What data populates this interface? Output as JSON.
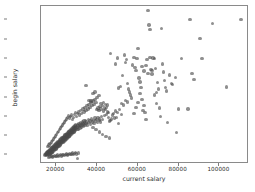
{
  "chart_data": {
    "type": "scatter",
    "title": "",
    "xlabel": "current salary",
    "ylabel": "begin salary",
    "xlim": [
      13000,
      114000
    ],
    "ylim": [
      8000,
      48500
    ],
    "grid": false,
    "legend": null,
    "marker": {
      "shape": "circle",
      "color": "#4b4b4b",
      "opacity": 0.62,
      "size_px": 3.4
    },
    "xticks": [
      20000,
      40000,
      60000,
      80000,
      100000
    ],
    "xtick_labels": [
      "20000",
      "40000",
      "60000",
      "80000",
      "100000"
    ],
    "yticks": [
      10000,
      15000,
      20000,
      25000,
      30000,
      35000,
      40000,
      45000
    ],
    "ytick_labels": [
      "10000",
      "15000",
      "20000",
      "25000",
      "30000",
      "35000",
      "40000",
      "45000"
    ],
    "points": [
      [
        15000,
        9800
      ],
      [
        15200,
        10100
      ],
      [
        15400,
        9900
      ],
      [
        15600,
        10300
      ],
      [
        15800,
        10000
      ],
      [
        15900,
        10500
      ],
      [
        16000,
        9750
      ],
      [
        16100,
        10200
      ],
      [
        16200,
        10600
      ],
      [
        16300,
        10000
      ],
      [
        16400,
        10800
      ],
      [
        16500,
        10300
      ],
      [
        16600,
        9900
      ],
      [
        16700,
        10450
      ],
      [
        16800,
        11000
      ],
      [
        16900,
        10200
      ],
      [
        17000,
        10700
      ],
      [
        17100,
        10000
      ],
      [
        17200,
        11200
      ],
      [
        17300,
        10500
      ],
      [
        17400,
        10900
      ],
      [
        17500,
        10100
      ],
      [
        17600,
        11400
      ],
      [
        17700,
        10600
      ],
      [
        17800,
        11000
      ],
      [
        17900,
        10300
      ],
      [
        18000,
        11600
      ],
      [
        18100,
        10800
      ],
      [
        18200,
        11200
      ],
      [
        18300,
        10400
      ],
      [
        18400,
        11800
      ],
      [
        18500,
        11000
      ],
      [
        18600,
        11400
      ],
      [
        18700,
        10600
      ],
      [
        18800,
        12000
      ],
      [
        18900,
        11200
      ],
      [
        19000,
        11600
      ],
      [
        19100,
        10800
      ],
      [
        19200,
        12200
      ],
      [
        19300,
        11400
      ],
      [
        19400,
        11800
      ],
      [
        19500,
        11000
      ],
      [
        19600,
        12400
      ],
      [
        19700,
        11600
      ],
      [
        19800,
        12000
      ],
      [
        19900,
        11200
      ],
      [
        20000,
        12600
      ],
      [
        20100,
        11800
      ],
      [
        20200,
        12200
      ],
      [
        20300,
        11400
      ],
      [
        20400,
        12800
      ],
      [
        20500,
        12000
      ],
      [
        20600,
        12400
      ],
      [
        20700,
        11600
      ],
      [
        20800,
        13000
      ],
      [
        20900,
        12200
      ],
      [
        21000,
        12600
      ],
      [
        21100,
        11800
      ],
      [
        21200,
        13200
      ],
      [
        21300,
        12400
      ],
      [
        21400,
        12800
      ],
      [
        21500,
        12000
      ],
      [
        21600,
        13400
      ],
      [
        21700,
        12600
      ],
      [
        21800,
        13000
      ],
      [
        21900,
        12200
      ],
      [
        22000,
        13600
      ],
      [
        22100,
        12800
      ],
      [
        22200,
        13200
      ],
      [
        22300,
        12400
      ],
      [
        22400,
        13800
      ],
      [
        22500,
        13000
      ],
      [
        22600,
        13400
      ],
      [
        22700,
        12600
      ],
      [
        22800,
        14000
      ],
      [
        22900,
        13200
      ],
      [
        23000,
        13600
      ],
      [
        23100,
        12800
      ],
      [
        23200,
        14200
      ],
      [
        23300,
        13400
      ],
      [
        23400,
        13800
      ],
      [
        23500,
        13000
      ],
      [
        23600,
        14400
      ],
      [
        23700,
        13600
      ],
      [
        23800,
        14000
      ],
      [
        23900,
        13200
      ],
      [
        24000,
        14600
      ],
      [
        24100,
        13800
      ],
      [
        24200,
        14200
      ],
      [
        24300,
        13400
      ],
      [
        24400,
        14800
      ],
      [
        24500,
        14000
      ],
      [
        24600,
        14400
      ],
      [
        24700,
        13600
      ],
      [
        24800,
        15000
      ],
      [
        24900,
        14200
      ],
      [
        25000,
        14600
      ],
      [
        25100,
        13800
      ],
      [
        25200,
        15200
      ],
      [
        25300,
        14400
      ],
      [
        25400,
        14800
      ],
      [
        25500,
        14000
      ],
      [
        25600,
        15400
      ],
      [
        25700,
        14600
      ],
      [
        25800,
        15000
      ],
      [
        25900,
        14200
      ],
      [
        26000,
        15600
      ],
      [
        26100,
        14800
      ],
      [
        26200,
        15200
      ],
      [
        26300,
        14400
      ],
      [
        26400,
        15800
      ],
      [
        26500,
        15000
      ],
      [
        26600,
        15400
      ],
      [
        26700,
        14600
      ],
      [
        26800,
        16000
      ],
      [
        26900,
        15200
      ],
      [
        27000,
        15600
      ],
      [
        27100,
        14800
      ],
      [
        27200,
        16200
      ],
      [
        27300,
        15400
      ],
      [
        27400,
        15800
      ],
      [
        27500,
        15000
      ],
      [
        27600,
        16400
      ],
      [
        27700,
        15600
      ],
      [
        27800,
        16000
      ],
      [
        27900,
        15200
      ],
      [
        28000,
        16600
      ],
      [
        28100,
        15800
      ],
      [
        28200,
        16200
      ],
      [
        28300,
        15400
      ],
      [
        28400,
        16800
      ],
      [
        28500,
        16000
      ],
      [
        28600,
        16400
      ],
      [
        28700,
        15600
      ],
      [
        28800,
        17000
      ],
      [
        28900,
        16200
      ],
      [
        29000,
        16600
      ],
      [
        29100,
        15800
      ],
      [
        29200,
        17200
      ],
      [
        29300,
        16400
      ],
      [
        29400,
        16800
      ],
      [
        29500,
        16000
      ],
      [
        29600,
        17400
      ],
      [
        29700,
        16600
      ],
      [
        29800,
        17000
      ],
      [
        29900,
        16200
      ],
      [
        30000,
        17600
      ],
      [
        30200,
        16800
      ],
      [
        30400,
        17200
      ],
      [
        30600,
        16400
      ],
      [
        30800,
        17800
      ],
      [
        31000,
        17000
      ],
      [
        31200,
        17400
      ],
      [
        31400,
        16600
      ],
      [
        31600,
        18000
      ],
      [
        31800,
        17200
      ],
      [
        32000,
        17600
      ],
      [
        32200,
        16800
      ],
      [
        32400,
        18200
      ],
      [
        32600,
        17400
      ],
      [
        32800,
        17800
      ],
      [
        33000,
        17000
      ],
      [
        33200,
        18400
      ],
      [
        33400,
        17600
      ],
      [
        33600,
        18000
      ],
      [
        33800,
        17200
      ],
      [
        34000,
        18600
      ],
      [
        34200,
        17800
      ],
      [
        34400,
        18200
      ],
      [
        34600,
        17400
      ],
      [
        34800,
        18800
      ],
      [
        35000,
        18000
      ],
      [
        35400,
        18400
      ],
      [
        35800,
        17600
      ],
      [
        36200,
        19000
      ],
      [
        36600,
        18200
      ],
      [
        37000,
        18600
      ],
      [
        37400,
        17800
      ],
      [
        37800,
        19200
      ],
      [
        38200,
        18400
      ],
      [
        38600,
        18800
      ],
      [
        39000,
        18000
      ],
      [
        39400,
        19400
      ],
      [
        39800,
        18600
      ],
      [
        40200,
        19000
      ],
      [
        40600,
        18200
      ],
      [
        41000,
        19600
      ],
      [
        41400,
        18800
      ],
      [
        41800,
        19200
      ],
      [
        42200,
        18400
      ],
      [
        42600,
        19800
      ],
      [
        43000,
        19000
      ],
      [
        17000,
        9200
      ],
      [
        17500,
        9400
      ],
      [
        18000,
        9600
      ],
      [
        18500,
        9300
      ],
      [
        19000,
        9500
      ],
      [
        19500,
        9700
      ],
      [
        20000,
        9400
      ],
      [
        20500,
        9600
      ],
      [
        21000,
        9800
      ],
      [
        21500,
        9500
      ],
      [
        22000,
        9700
      ],
      [
        22500,
        9900
      ],
      [
        23000,
        9600
      ],
      [
        23500,
        9800
      ],
      [
        24000,
        10000
      ],
      [
        24500,
        9700
      ],
      [
        25000,
        9900
      ],
      [
        25500,
        10100
      ],
      [
        26000,
        9800
      ],
      [
        26500,
        10000
      ],
      [
        27000,
        10200
      ],
      [
        27500,
        9900
      ],
      [
        28000,
        10100
      ],
      [
        28500,
        10300
      ],
      [
        29000,
        10000
      ],
      [
        29500,
        10200
      ],
      [
        30000,
        10400
      ],
      [
        30500,
        10100
      ],
      [
        31000,
        8950
      ],
      [
        31500,
        10300
      ],
      [
        16500,
        12000
      ],
      [
        17000,
        12400
      ],
      [
        17500,
        12800
      ],
      [
        18000,
        13200
      ],
      [
        18500,
        13600
      ],
      [
        19000,
        14000
      ],
      [
        19500,
        14400
      ],
      [
        20000,
        14800
      ],
      [
        20500,
        15200
      ],
      [
        21000,
        15600
      ],
      [
        21500,
        16000
      ],
      [
        22000,
        16400
      ],
      [
        22500,
        16800
      ],
      [
        23000,
        17200
      ],
      [
        23500,
        17600
      ],
      [
        24000,
        18000
      ],
      [
        24500,
        18400
      ],
      [
        25000,
        18800
      ],
      [
        25500,
        19200
      ],
      [
        26000,
        19600
      ],
      [
        26500,
        20000
      ],
      [
        27000,
        19400
      ],
      [
        27500,
        19800
      ],
      [
        28000,
        20200
      ],
      [
        28500,
        19000
      ],
      [
        29000,
        19600
      ],
      [
        29500,
        20400
      ],
      [
        30000,
        20800
      ],
      [
        30500,
        19800
      ],
      [
        31000,
        20600
      ],
      [
        31500,
        21000
      ],
      [
        32000,
        20200
      ],
      [
        32500,
        21400
      ],
      [
        33000,
        20600
      ],
      [
        33500,
        21800
      ],
      [
        34000,
        21000
      ],
      [
        34500,
        22200
      ],
      [
        35000,
        21400
      ],
      [
        35500,
        22600
      ],
      [
        36000,
        21800
      ],
      [
        36500,
        23000
      ],
      [
        37000,
        22200
      ],
      [
        37500,
        23400
      ],
      [
        38000,
        22600
      ],
      [
        38500,
        23800
      ],
      [
        39000,
        23000
      ],
      [
        39500,
        24200
      ],
      [
        40000,
        23400
      ],
      [
        40500,
        21600
      ],
      [
        41000,
        22000
      ],
      [
        41500,
        21400
      ],
      [
        42000,
        22400
      ],
      [
        42500,
        21800
      ],
      [
        43000,
        22600
      ],
      [
        43500,
        21200
      ],
      [
        44000,
        22000
      ],
      [
        44500,
        21600
      ],
      [
        45000,
        22200
      ],
      [
        45500,
        21000
      ],
      [
        46000,
        20800
      ],
      [
        46500,
        14200
      ],
      [
        44800,
        14600
      ],
      [
        43200,
        15200
      ],
      [
        41600,
        15800
      ],
      [
        40000,
        16400
      ],
      [
        38400,
        17000
      ],
      [
        35000,
        27800
      ],
      [
        38500,
        25800
      ],
      [
        39500,
        26200
      ],
      [
        40500,
        24800
      ],
      [
        41500,
        25200
      ],
      [
        36500,
        24000
      ],
      [
        37500,
        23800
      ],
      [
        42500,
        23200
      ],
      [
        43500,
        23400
      ],
      [
        44500,
        23000
      ],
      [
        45500,
        22800
      ],
      [
        46500,
        18600
      ],
      [
        47500,
        19200
      ],
      [
        48500,
        20600
      ],
      [
        49500,
        21200
      ],
      [
        50500,
        20800
      ],
      [
        51500,
        21600
      ],
      [
        52500,
        20400
      ],
      [
        47000,
        36200
      ],
      [
        49500,
        33400
      ],
      [
        50500,
        35000
      ],
      [
        51000,
        27200
      ],
      [
        52000,
        27600
      ],
      [
        53000,
        30400
      ],
      [
        54000,
        35800
      ],
      [
        54500,
        33800
      ],
      [
        55000,
        34600
      ],
      [
        55500,
        28400
      ],
      [
        56000,
        27000
      ],
      [
        56500,
        26200
      ],
      [
        57000,
        25400
      ],
      [
        57500,
        24600
      ],
      [
        58000,
        33200
      ],
      [
        58500,
        35200
      ],
      [
        59000,
        32600
      ],
      [
        59500,
        31800
      ],
      [
        60000,
        34800
      ],
      [
        60500,
        37400
      ],
      [
        61000,
        29800
      ],
      [
        61500,
        28800
      ],
      [
        62000,
        27400
      ],
      [
        62500,
        24200
      ],
      [
        63000,
        21400
      ],
      [
        63500,
        22600
      ],
      [
        64000,
        20800
      ],
      [
        64500,
        19000
      ],
      [
        65000,
        34600
      ],
      [
        65500,
        47300
      ],
      [
        66000,
        43600
      ],
      [
        66500,
        42400
      ],
      [
        67000,
        32000
      ],
      [
        67500,
        31800
      ],
      [
        68000,
        35000
      ],
      [
        68500,
        34900
      ],
      [
        69000,
        32200
      ],
      [
        69500,
        26000
      ],
      [
        70000,
        28600
      ],
      [
        70500,
        27000
      ],
      [
        71000,
        22000
      ],
      [
        71500,
        19800
      ],
      [
        72000,
        42600
      ],
      [
        72500,
        33400
      ],
      [
        73000,
        31400
      ],
      [
        73500,
        29200
      ],
      [
        74000,
        27400
      ],
      [
        74500,
        26400
      ],
      [
        75000,
        18200
      ],
      [
        76000,
        30600
      ],
      [
        77000,
        28400
      ],
      [
        77500,
        28200
      ],
      [
        79000,
        30000
      ],
      [
        79500,
        15700
      ],
      [
        80500,
        21800
      ],
      [
        82000,
        34800
      ],
      [
        85000,
        21800
      ],
      [
        86000,
        45000
      ],
      [
        87000,
        31000
      ],
      [
        88000,
        29400
      ],
      [
        91000,
        40000
      ],
      [
        92000,
        34900
      ],
      [
        97000,
        44000
      ],
      [
        104000,
        27500
      ],
      [
        111000,
        45000
      ],
      [
        52500,
        23200
      ],
      [
        53500,
        22800
      ],
      [
        54500,
        24000
      ],
      [
        55500,
        23600
      ],
      [
        50000,
        19600
      ],
      [
        51000,
        18000
      ],
      [
        48000,
        20200
      ],
      [
        49000,
        19400
      ],
      [
        45000,
        20400
      ],
      [
        46000,
        19600
      ],
      [
        47000,
        18800
      ],
      [
        44000,
        20000
      ],
      [
        58500,
        20600
      ],
      [
        59500,
        22200
      ],
      [
        60500,
        23400
      ],
      [
        61500,
        25800
      ],
      [
        62500,
        32800
      ],
      [
        63500,
        31600
      ],
      [
        64500,
        33000
      ],
      [
        65500,
        31000
      ],
      [
        66500,
        35200
      ],
      [
        67500,
        30800
      ],
      [
        68500,
        25400
      ],
      [
        69500,
        23200
      ]
    ]
  }
}
